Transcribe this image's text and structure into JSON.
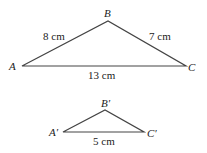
{
  "diagram": {
    "large_triangle": {
      "vertices": {
        "A": "A",
        "B": "B",
        "C": "C"
      },
      "sides": {
        "AB": "8 cm",
        "BC": "7 cm",
        "AC": "13 cm"
      }
    },
    "small_triangle": {
      "vertices": {
        "A": "A′",
        "B": "B′",
        "C": "C′"
      },
      "sides": {
        "AC": "5 cm"
      }
    }
  }
}
